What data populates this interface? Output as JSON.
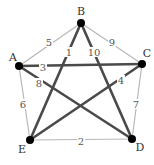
{
  "graph": {
    "nodes": [
      {
        "id": "A",
        "label": "A",
        "x": 19,
        "y": 66,
        "lx": 13,
        "ly": 61
      },
      {
        "id": "B",
        "label": "B",
        "x": 81,
        "y": 23,
        "lx": 81,
        "ly": 15
      },
      {
        "id": "C",
        "label": "C",
        "x": 142,
        "y": 64,
        "lx": 147,
        "ly": 57
      },
      {
        "id": "D",
        "label": "D",
        "x": 132,
        "y": 139,
        "lx": 140,
        "ly": 151
      },
      {
        "id": "E",
        "label": "E",
        "x": 30,
        "y": 140,
        "lx": 22,
        "ly": 153
      }
    ],
    "edges": [
      {
        "from": "A",
        "to": "B",
        "weight": "5",
        "style": "thin",
        "lx": 49,
        "ly": 44
      },
      {
        "from": "B",
        "to": "C",
        "weight": "9",
        "style": "thin",
        "lx": 112,
        "ly": 44
      },
      {
        "from": "C",
        "to": "D",
        "weight": "7",
        "style": "thin",
        "lx": 136,
        "ly": 106
      },
      {
        "from": "D",
        "to": "E",
        "weight": "2",
        "style": "thin",
        "lx": 81,
        "ly": 143
      },
      {
        "from": "A",
        "to": "E",
        "weight": "6",
        "style": "thin",
        "lx": 23,
        "ly": 106
      },
      {
        "from": "A",
        "to": "C",
        "weight": "3",
        "style": "thick",
        "lx": 43,
        "ly": 69
      },
      {
        "from": "B",
        "to": "E",
        "weight": "1",
        "style": "thick",
        "lx": 69,
        "ly": 54
      },
      {
        "from": "B",
        "to": "D",
        "weight": "10",
        "style": "thick",
        "lx": 94,
        "ly": 54
      },
      {
        "from": "C",
        "to": "E",
        "weight": "4",
        "style": "thick",
        "lx": 121,
        "ly": 82
      },
      {
        "from": "A",
        "to": "D",
        "weight": "8",
        "style": "thick",
        "lx": 39,
        "ly": 85
      }
    ]
  },
  "colors": {
    "thick_edge": "#4a4a4a",
    "thin_edge": "#b8b8b8",
    "node": "#000000"
  }
}
